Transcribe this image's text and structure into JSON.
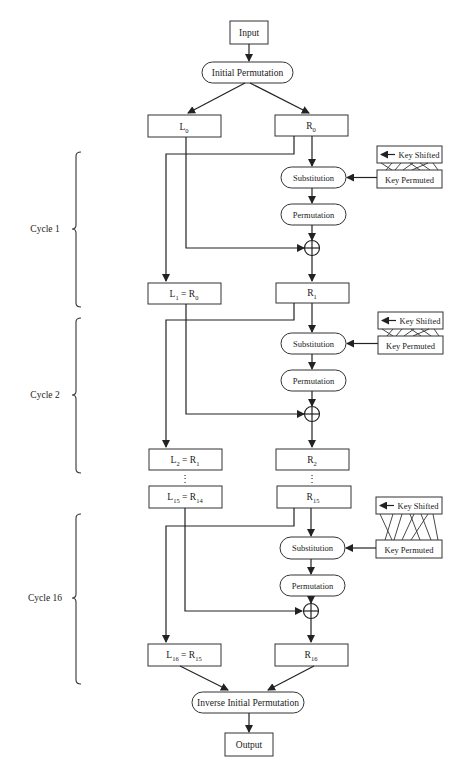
{
  "diagram": {
    "input": "Input",
    "initial_permutation": "Initial Permutation",
    "inverse_initial_permutation": "Inverse Initial Permutation",
    "output": "Output",
    "ellipsis": "⋮",
    "xor_symbol": "⊕",
    "key_shifted": "Key Shifted",
    "key_permuted": "Key Permuted",
    "substitution": "Substitution",
    "permutation": "Permutation",
    "start_blocks": {
      "left": {
        "base": "L",
        "sub": "0"
      },
      "right": {
        "base": "R",
        "sub": "0"
      }
    },
    "cycles": [
      {
        "label": "Cycle 1",
        "left_out": {
          "base": "L",
          "sub": "1",
          "eq": " = R",
          "eqsub": "0"
        },
        "right_out": {
          "base": "R",
          "sub": "1"
        }
      },
      {
        "label": "Cycle 2",
        "left_out": {
          "base": "L",
          "sub": "2",
          "eq": " = R",
          "eqsub": "1"
        },
        "right_out": {
          "base": "R",
          "sub": "2"
        }
      },
      {
        "label": "Cycle 16",
        "left_in": {
          "base": "L",
          "sub": "15",
          "eq": " = R",
          "eqsub": "14"
        },
        "right_in": {
          "base": "R",
          "sub": "15"
        },
        "left_out": {
          "base": "L",
          "sub": "16",
          "eq": " = R",
          "eqsub": "15"
        },
        "right_out": {
          "base": "R",
          "sub": "16"
        }
      }
    ],
    "colors": {
      "stroke": "#222222",
      "background": "#ffffff",
      "text": "#1a1a1a"
    }
  }
}
